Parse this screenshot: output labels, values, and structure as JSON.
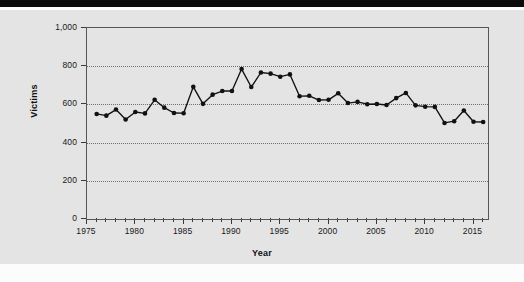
{
  "chart_data": {
    "type": "line",
    "title": "",
    "xlabel": "Year",
    "ylabel": "Victims",
    "xlim": [
      1975,
      2016.5
    ],
    "ylim": [
      0,
      1000
    ],
    "grid": true,
    "legend": "none",
    "marker": "filled-circle",
    "line_color": "#111113",
    "x": [
      1976,
      1977,
      1978,
      1979,
      1980,
      1981,
      1982,
      1983,
      1984,
      1985,
      1986,
      1987,
      1988,
      1989,
      1990,
      1991,
      1992,
      1993,
      1994,
      1995,
      1996,
      1997,
      1998,
      1999,
      2000,
      2001,
      2002,
      2003,
      2004,
      2005,
      2006,
      2007,
      2008,
      2009,
      2010,
      2011,
      2012,
      2013,
      2014,
      2015,
      2016
    ],
    "values": [
      550,
      541,
      573,
      521,
      560,
      553,
      624,
      583,
      555,
      554,
      692,
      603,
      651,
      670,
      670,
      785,
      691,
      767,
      761,
      745,
      757,
      643,
      645,
      623,
      624,
      658,
      607,
      613,
      601,
      602,
      597,
      633,
      660,
      595,
      588,
      587,
      503,
      512,
      568,
      509,
      508
    ],
    "series": [
      {
        "name": "Victims",
        "values": [
          550,
          541,
          573,
          521,
          560,
          553,
          624,
          583,
          555,
          554,
          692,
          603,
          651,
          670,
          670,
          785,
          691,
          767,
          761,
          745,
          757,
          643,
          645,
          623,
          624,
          658,
          607,
          613,
          601,
          602,
          597,
          633,
          660,
          595,
          588,
          587,
          503,
          512,
          568,
          509,
          508
        ]
      }
    ],
    "ytick_values": [
      0,
      200,
      400,
      600,
      800,
      1000
    ],
    "ytick_labels": [
      "0",
      "200",
      "400",
      "600",
      "800",
      "1,000"
    ],
    "xtick_major_values": [
      1975,
      1980,
      1985,
      1990,
      1995,
      2000,
      2005,
      2010,
      2015
    ],
    "xtick_major_labels": [
      "1975",
      "1980",
      "1985",
      "1990",
      "1995",
      "2000",
      "2005",
      "2010",
      "2015"
    ],
    "xtick_minor_step": 1
  }
}
